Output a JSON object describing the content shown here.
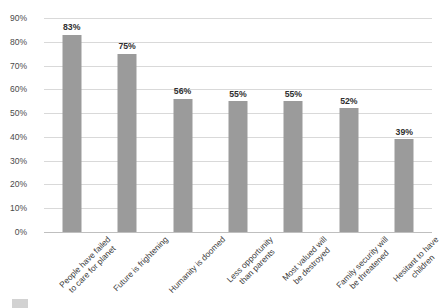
{
  "chart_data": {
    "type": "bar",
    "title": "",
    "subtitle": "",
    "xlabel": "",
    "ylabel": "",
    "ylim": [
      0,
      90
    ],
    "ytick_step": 10,
    "grid": true,
    "legend_position": "bottom-left",
    "bar_color": "#9b9b9b",
    "gridline_color": "#d9d9d9",
    "value_label_color": "#2f2f2f",
    "axis_text_color": "#4a4a4a",
    "categories": [
      "People have failed to care for planet",
      "Future is frightening",
      "Humanity is doomed",
      "Less opportunity than parents",
      "Most valued will be destroyed",
      "Family security will be threatened",
      "Hesitant to have children"
    ],
    "category_lines": [
      [
        "People have failed",
        "to care for planet"
      ],
      [
        "Future is frightening",
        ""
      ],
      [
        "Humanity is doomed",
        ""
      ],
      [
        "Less opportunity",
        "than parents"
      ],
      [
        "Most valued will",
        "be destroyed"
      ],
      [
        "Family security will",
        "be threatened"
      ],
      [
        "Hesitant to have",
        "children"
      ]
    ],
    "values": [
      83,
      75,
      56,
      55,
      55,
      52,
      39
    ],
    "value_labels": [
      "83%",
      "75%",
      "56%",
      "55%",
      "55%",
      "52%",
      "39%"
    ],
    "ytick_labels": [
      "0%",
      "10%",
      "20%",
      "30%",
      "40%",
      "50%",
      "60%",
      "70%",
      "80%",
      "90%"
    ],
    "ytick_values": [
      0,
      10,
      20,
      30,
      40,
      50,
      60,
      70,
      80,
      90
    ],
    "series": [
      {
        "name": "",
        "values": [
          83,
          75,
          56,
          55,
          55,
          52,
          39
        ]
      }
    ]
  },
  "legend": {
    "label": ""
  }
}
